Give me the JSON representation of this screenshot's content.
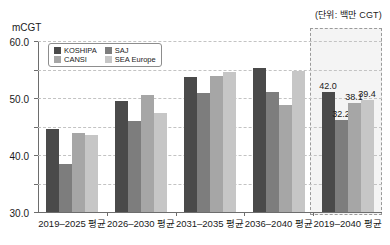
{
  "unit_note": "(단위: 백만 CGT)",
  "y_axis_title": "mCGT",
  "legend": {
    "items": [
      {
        "label": "KOSHIPA",
        "color": "#4a4a4a"
      },
      {
        "label": "SAJ",
        "color": "#7d7d7d"
      },
      {
        "label": "CANSI",
        "color": "#a6a6a6"
      },
      {
        "label": "SEA Europe",
        "color": "#c6c6c6"
      }
    ]
  },
  "chart_data": {
    "type": "bar",
    "title": "",
    "xlabel": "",
    "ylabel": "mCGT",
    "ylim": [
      0.0,
      60.0
    ],
    "yticks": [
      "0.0",
      "10.0",
      "20.0",
      "30.0",
      "40.0",
      "50.0",
      "60.0"
    ],
    "ytick_values": [
      0.0,
      10.0,
      20.0,
      30.0,
      40.0,
      50.0,
      60.0
    ],
    "grid": true,
    "legend_position": "upper-left-inside",
    "categories": [
      "2019–2025 평균",
      "2026–2030 평균",
      "2031–2035 평균",
      "2036–2040 평균",
      "2019–2040 평균"
    ],
    "series": [
      {
        "name": "KOSHIPA",
        "color": "#4a4a4a",
        "values": [
          29.2,
          38.8,
          47.5,
          50.7,
          42.0
        ]
      },
      {
        "name": "SAJ",
        "color": "#7d7d7d",
        "values": [
          16.8,
          32.0,
          41.8,
          42.0,
          32.2
        ]
      },
      {
        "name": "CANSI",
        "color": "#a6a6a6",
        "values": [
          27.8,
          41.2,
          47.6,
          37.7,
          38.1
        ]
      },
      {
        "name": "SEA Europe",
        "color": "#c6c6c6",
        "values": [
          27.1,
          34.8,
          49.0,
          49.5,
          39.4
        ]
      }
    ],
    "data_labels": {
      "group": "2019–2040 평균",
      "values": [
        "42.0",
        "32.2",
        "38.1",
        "39.4"
      ]
    },
    "highlight": {
      "category": "2019–2040 평균",
      "style": "dashed-box",
      "fill": "#f4f4f4",
      "border": "#9a9a9a"
    }
  }
}
